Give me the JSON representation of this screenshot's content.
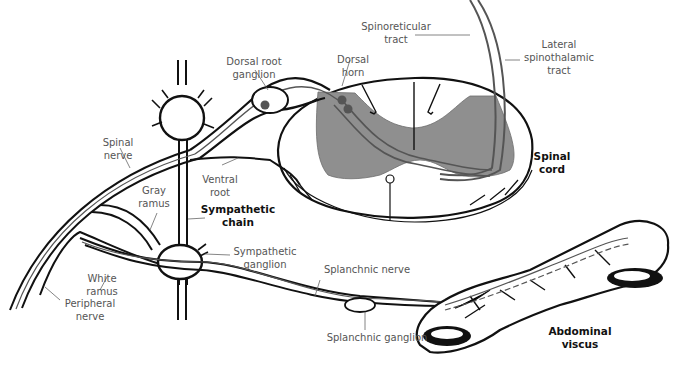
{
  "diagram": {
    "colors": {
      "ink": "#111111",
      "gray_matter": "#8f8f8f",
      "pathway": "#555555",
      "label_text": "#555555",
      "leader_line": "#666666"
    },
    "labels": {
      "spinoreticular_tract": "Spinoreticular\ntract",
      "lateral_spinothalamic_tract": "Lateral\nspinothalamic\ntract",
      "dorsal_root_ganglion": "Dorsal root\nganglion",
      "dorsal_horn": "Dorsal\nhorn",
      "spinal_nerve": "Spinal\nnerve",
      "ventral_root": "Ventral\nroot",
      "gray_ramus": "Gray\nramus",
      "sympathetic_chain": "Sympathetic\nchain",
      "spinal_cord": "Spinal\ncord",
      "sympathetic_ganglion": "Sympathetic\nganglion",
      "splanchnic_nerve": "Splanchnic nerve",
      "white_ramus": "White\nramus",
      "peripheral_nerve": "Peripheral\nnerve",
      "splanchnic_ganglion": "Splanchnic ganglion",
      "abdominal_viscus": "Abdominal\nviscus"
    }
  }
}
